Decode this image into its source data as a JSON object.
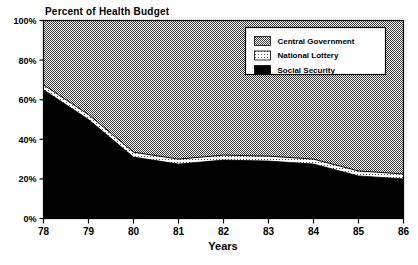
{
  "chart_data": {
    "type": "area",
    "title": "Percent of Health Budget",
    "subtitle": "",
    "xlabel": "Years",
    "ylabel": "",
    "stacked": true,
    "stack_total": 100,
    "grid": false,
    "legend_position": "top-right",
    "x": [
      78,
      79,
      80,
      81,
      82,
      83,
      84,
      85,
      86
    ],
    "categories": [
      "78",
      "79",
      "80",
      "81",
      "82",
      "83",
      "84",
      "85",
      "86"
    ],
    "xtick_labels": [
      "78",
      "79",
      "80",
      "81",
      "82",
      "83",
      "84",
      "85",
      "86"
    ],
    "ytick_labels": [
      "0%",
      "20%",
      "40%",
      "60%",
      "80%",
      "100%"
    ],
    "ytick_values": [
      0,
      20,
      40,
      60,
      80,
      100
    ],
    "xlim": [
      78,
      86
    ],
    "ylim": [
      0,
      100
    ],
    "series": [
      {
        "name": "Social Security",
        "pattern": "solid-black",
        "color": "#000000",
        "values": [
          65,
          50,
          31,
          27.5,
          29.5,
          29,
          27.5,
          21.5,
          20
        ]
      },
      {
        "name": "National Lottery",
        "pattern": "light-dots",
        "color": "#e8e8e8",
        "values": [
          2.5,
          2.5,
          2.5,
          2.5,
          2.5,
          2.5,
          2.5,
          2.5,
          2.5
        ]
      },
      {
        "name": "Central Government",
        "pattern": "gray-checker",
        "color": "#9a9a9a",
        "values": [
          32.5,
          47.5,
          66.5,
          70,
          68,
          68.5,
          70,
          76,
          77.5
        ]
      }
    ],
    "cumulative_tops": {
      "social_security": [
        65,
        50,
        31,
        27.5,
        29.5,
        29,
        27.5,
        21.5,
        20
      ],
      "national_lottery": [
        67.5,
        52.5,
        33.5,
        30,
        32,
        31.5,
        30,
        24,
        22.5
      ],
      "central_government": [
        100,
        100,
        100,
        100,
        100,
        100,
        100,
        100,
        100
      ]
    }
  },
  "legend": {
    "entries": [
      {
        "label": "Central Government",
        "pattern": "gray-checker"
      },
      {
        "label": "National Lottery",
        "pattern": "light-dots"
      },
      {
        "label": "Social Security",
        "pattern": "solid-black"
      }
    ]
  },
  "footer": {
    "smudge_text": ""
  }
}
